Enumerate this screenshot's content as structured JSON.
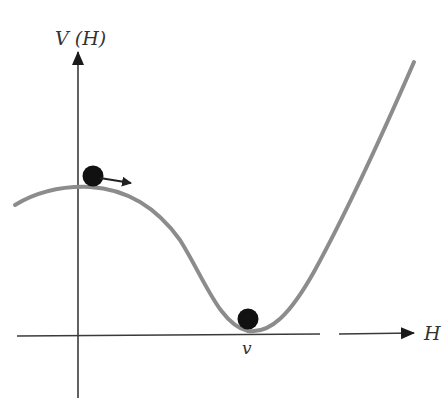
{
  "diagram": {
    "y_axis_label": "V (H)",
    "x_axis_label": "H",
    "minimum_label": "v",
    "colors": {
      "axis": "#3a3a3a",
      "curve": "#8c8c8c",
      "ball": "#111111",
      "label": "#333333",
      "background": "#ffffff"
    },
    "elements": [
      {
        "name": "potential-curve",
        "description": "V(H) curve with local maximum near H=0 and minimum at H=v"
      },
      {
        "name": "ball-top",
        "description": "ball on the local maximum with arrow pointing right"
      },
      {
        "name": "ball-bottom",
        "description": "ball resting at the minimum v"
      }
    ]
  }
}
